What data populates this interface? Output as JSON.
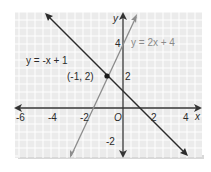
{
  "graph": {
    "title": "",
    "axes": {
      "x_label": "x",
      "y_label": "y",
      "origin_label": "O",
      "x_ticks": [
        "-6",
        "-4",
        "-2",
        "2",
        "4"
      ],
      "y_ticks": [
        "4",
        "2",
        "-2"
      ],
      "xlim": [
        -6.5,
        4.5
      ],
      "ylim": [
        -3,
        6
      ]
    },
    "lines": [
      {
        "label": "y = -x + 1",
        "slope": -1,
        "intercept": 1,
        "color": "#2b2b2b"
      },
      {
        "label": "y = 2x + 4",
        "slope": 2,
        "intercept": 4,
        "color": "#8c8c8c"
      }
    ],
    "intersection": {
      "label": "(-1, 2)",
      "x": -1,
      "y": 2
    },
    "colors": {
      "panel": "#ececec",
      "grid": "#ffffff",
      "axis": "#333333"
    }
  }
}
